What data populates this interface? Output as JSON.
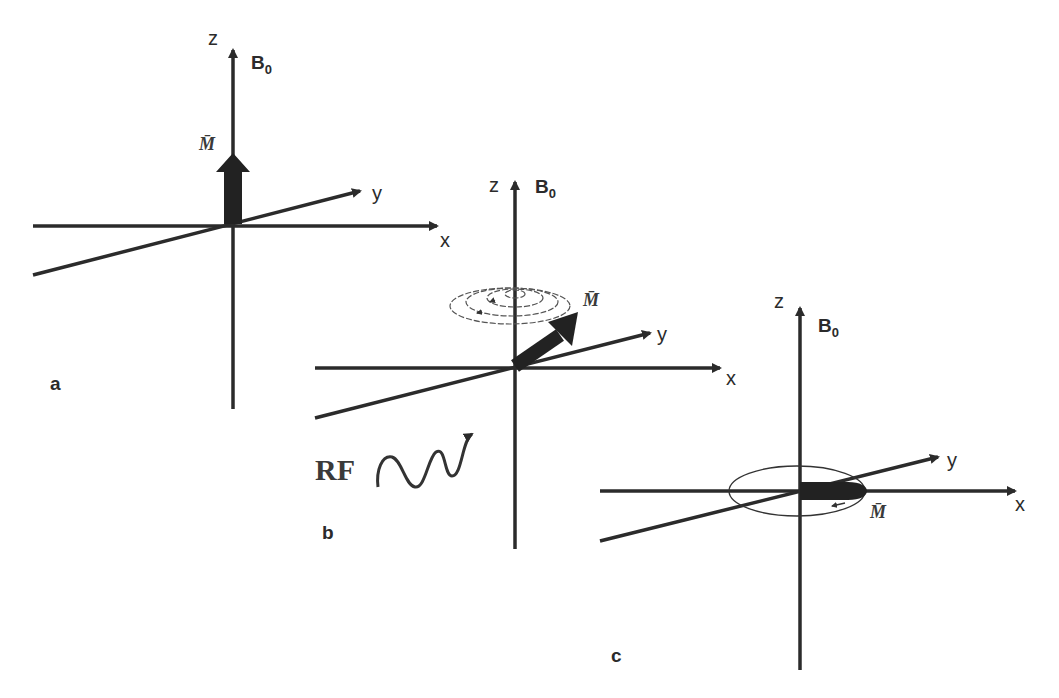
{
  "figure": {
    "colors": {
      "stroke": "#2b2b2b",
      "background": "#ffffff"
    },
    "panels": [
      {
        "id": "a",
        "label": "a",
        "axes": {
          "z": "z",
          "y": "y",
          "x": "x",
          "field": "B",
          "field_sub": "0"
        },
        "vector_label": "M̄",
        "vector_direction": "along z"
      },
      {
        "id": "b",
        "label": "b",
        "axes": {
          "z": "z",
          "y": "y",
          "x": "x",
          "field": "B",
          "field_sub": "0"
        },
        "vector_label": "M̄",
        "vector_direction": "tipped, precessing (spiral)",
        "rf_label": "RF"
      },
      {
        "id": "c",
        "label": "c",
        "axes": {
          "z": "z",
          "y": "y",
          "x": "x",
          "field": "B",
          "field_sub": "0"
        },
        "vector_label": "M̄",
        "vector_direction": "in x-y plane, rotating"
      }
    ]
  }
}
